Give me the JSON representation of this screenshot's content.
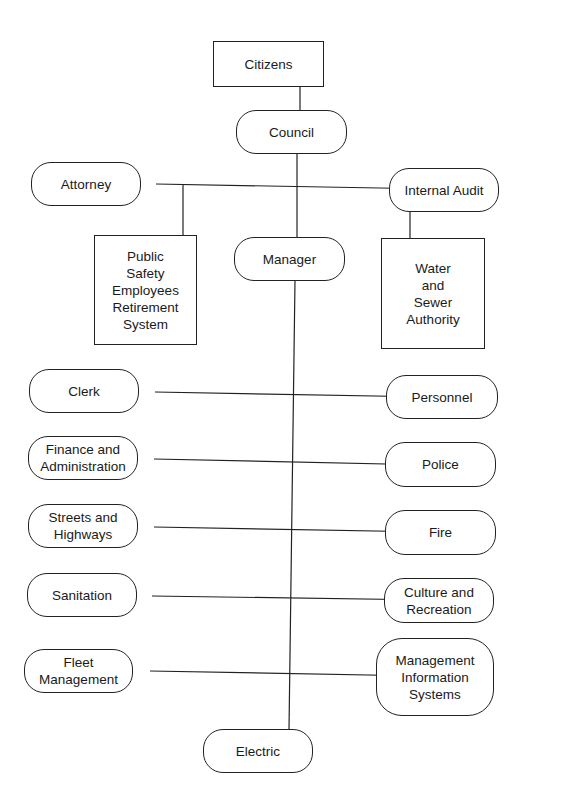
{
  "diagram": {
    "type": "organizational chart",
    "nodes": {
      "citizens": "Citizens",
      "council": "Council",
      "attorney": "Attorney",
      "internal_audit": "Internal Audit",
      "psers": "Public\nSafety\nEmployees\nRetirement\nSystem",
      "manager": "Manager",
      "water_sewer": "Water\nand\nSewer\nAuthority",
      "clerk": "Clerk",
      "personnel": "Personnel",
      "finance": "Finance and\nAdministration",
      "police": "Police",
      "streets": "Streets and\nHighways",
      "fire": "Fire",
      "sanitation": "Sanitation",
      "culture": "Culture and\nRecreation",
      "fleet": "Fleet\nManagement",
      "mis": "Management\nInformation\nSystems",
      "electric": "Electric"
    },
    "edges": [
      [
        "Citizens",
        "Council"
      ],
      [
        "Council",
        "Attorney"
      ],
      [
        "Council",
        "Internal Audit"
      ],
      [
        "Council",
        "Public Safety Employees Retirement System"
      ],
      [
        "Council",
        "Manager"
      ],
      [
        "Council",
        "Water and Sewer Authority"
      ],
      [
        "Manager",
        "Clerk"
      ],
      [
        "Manager",
        "Personnel"
      ],
      [
        "Manager",
        "Finance and Administration"
      ],
      [
        "Manager",
        "Police"
      ],
      [
        "Manager",
        "Streets and Highways"
      ],
      [
        "Manager",
        "Fire"
      ],
      [
        "Manager",
        "Sanitation"
      ],
      [
        "Manager",
        "Culture and Recreation"
      ],
      [
        "Manager",
        "Fleet Management"
      ],
      [
        "Manager",
        "Management Information Systems"
      ],
      [
        "Manager",
        "Electric"
      ]
    ]
  }
}
